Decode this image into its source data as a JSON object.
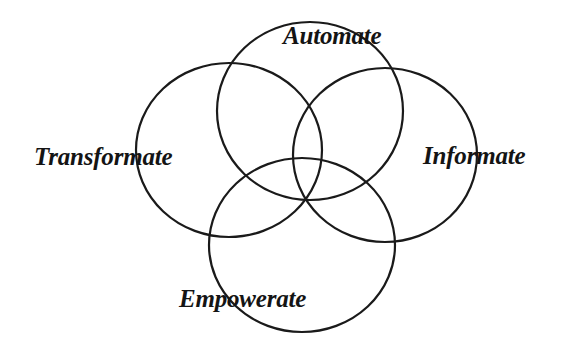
{
  "diagram": {
    "type": "four-circle-venn",
    "colors": {
      "stroke": "#1a1a1a",
      "text": "#141414",
      "background": "#ffffff"
    },
    "circles": [
      {
        "id": "automate",
        "cx": 310,
        "cy": 111,
        "rx": 93,
        "ry": 89
      },
      {
        "id": "transformate",
        "cx": 229,
        "cy": 150,
        "rx": 93,
        "ry": 87
      },
      {
        "id": "informate",
        "cx": 385,
        "cy": 155,
        "rx": 92,
        "ry": 87
      },
      {
        "id": "empowerate",
        "cx": 302,
        "cy": 245,
        "rx": 93,
        "ry": 87
      }
    ],
    "labels": {
      "automate": {
        "text": "Automate",
        "x": 283,
        "y": 44
      },
      "transformate": {
        "text": "Transformate",
        "x": 34,
        "y": 165
      },
      "informate": {
        "text": "Informate",
        "x": 423,
        "y": 164
      },
      "empowerate": {
        "text": "Empowerate",
        "x": 179,
        "y": 307
      }
    }
  }
}
